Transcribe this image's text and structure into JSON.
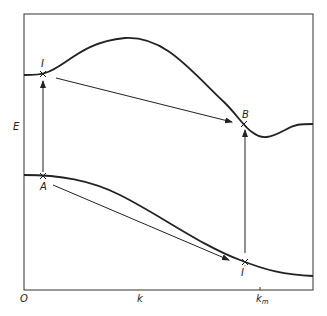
{
  "diagram": {
    "type": "energy band diagram",
    "axes": {
      "y_label": "E",
      "x_label": "k",
      "origin_label": "O",
      "x_tick_label": "k",
      "x_tick_subscript": "m"
    },
    "points": {
      "I": "I",
      "B": "B",
      "A": "A",
      "I_prime": "I",
      "I_prime_mark": "′"
    },
    "curves": [
      "conduction band (upper)",
      "valence band (lower)"
    ],
    "arrows": [
      "A to I (vertical)",
      "I to B (diagonal)",
      "A to I' (diagonal)",
      "I' to B (vertical)"
    ],
    "colors": {
      "line": "#222222",
      "background": "#ffffff"
    }
  }
}
